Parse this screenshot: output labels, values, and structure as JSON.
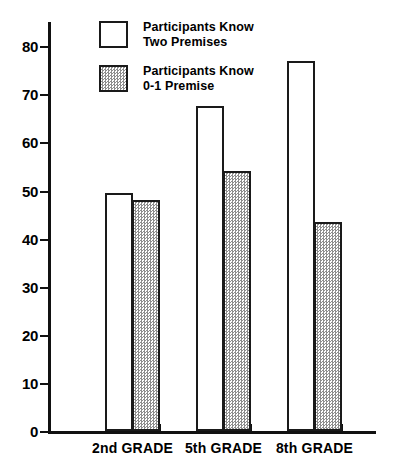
{
  "chart_data": {
    "type": "bar",
    "title": "",
    "subtitle": "",
    "xlabel": "",
    "ylabel": "",
    "categories": [
      "2nd GRADE",
      "5th GRADE",
      "8th GRADE"
    ],
    "series": [
      {
        "name": "Participants Know Two Premises",
        "legend_line1": "Participants Know",
        "legend_line2": "Two Premises",
        "style": "open",
        "values": [
          49.5,
          67.5,
          77
        ]
      },
      {
        "name": "Participants Know 0-1 Premise",
        "legend_line1": "Participants Know",
        "legend_line2": "0-1 Premise",
        "style": "hatched",
        "values": [
          48,
          54,
          43.5
        ]
      }
    ],
    "ylim": [
      0,
      85
    ],
    "yticks": [
      0,
      10,
      20,
      30,
      40,
      50,
      60,
      70,
      80
    ],
    "ytick_labels": [
      "0",
      "10",
      "20",
      "30",
      "40",
      "50",
      "60",
      "70",
      "80"
    ],
    "grid": false,
    "legend_position": "top-left-inside",
    "colors": {
      "axis": "#111111",
      "bar_outline": "#1a1a1a",
      "bar_open_fill": "#ffffff",
      "bar_hatched_fill": "#8e8e8e",
      "background": "#ffffff",
      "text": "#000000"
    }
  }
}
